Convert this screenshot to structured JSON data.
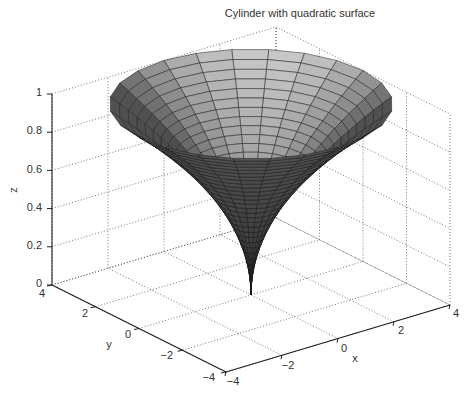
{
  "chart_data": {
    "type": "surface3d",
    "title": "Cylinder with quadratic surface",
    "xlabel": "x",
    "ylabel": "y",
    "zlabel": "z",
    "xlim": [
      -4,
      4
    ],
    "ylim": [
      -4,
      4
    ],
    "zlim": [
      0,
      1
    ],
    "x_ticks": [
      "-4",
      "-2",
      "0",
      "2",
      "4"
    ],
    "y_ticks": [
      "-4",
      "-2",
      "0",
      "2",
      "4"
    ],
    "z_ticks": [
      "0",
      "0.2",
      "0.4",
      "0.6",
      "0.8",
      "1"
    ],
    "grid": true,
    "colormap": "gray",
    "surface": {
      "description": "Surface of revolution (cylinder function) with profile r(t) = t^2, t in [0,1]; radius grows quadratically with height z",
      "profile_r_at_z": [
        {
          "z": 0.0,
          "r": 0.0
        },
        {
          "z": 0.2,
          "r": 0.16
        },
        {
          "z": 0.4,
          "r": 0.64
        },
        {
          "z": 0.6,
          "r": 1.44
        },
        {
          "z": 0.8,
          "r": 2.56
        },
        {
          "z": 1.0,
          "r": 4.0
        }
      ],
      "max_radius": 4,
      "height": 1
    }
  },
  "labels": {
    "title": "Cylinder with quadratic surface",
    "x": "x",
    "y": "y",
    "z": "z",
    "x_ticks": [
      "−4",
      "−2",
      "0",
      "2",
      "4"
    ],
    "y_ticks": [
      "−4",
      "−2",
      "0",
      "2",
      "4"
    ],
    "z_ticks": [
      "0",
      "0.2",
      "0.4",
      "0.6",
      "0.8",
      "1"
    ]
  },
  "colors": {
    "axis": "#222222",
    "grid": "#555555",
    "mesh": "#1a1a1a",
    "surface_dark": "#3a3a3a",
    "surface_light": "#bdbdbd"
  }
}
